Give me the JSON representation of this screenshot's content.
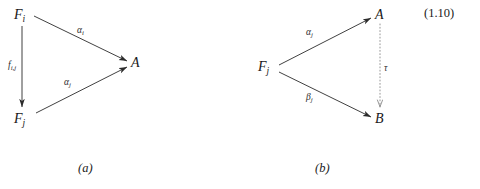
{
  "figure": {
    "equation_number": "(1.10)",
    "line_color": "#2b2b2b",
    "dotted_line_color": "#8a8a8a",
    "text_color": "#1a1a1a",
    "background_color": "#ffffff",
    "diagrams": [
      {
        "id": "a",
        "caption": "(a)",
        "nodes": [
          {
            "name": "node-f-i",
            "base": "F",
            "subscript": "i",
            "x": 14,
            "y": 8
          },
          {
            "name": "node-f-j",
            "base": "F",
            "subscript": "j",
            "x": 14,
            "y": 112
          },
          {
            "name": "node-a",
            "base": "A",
            "subscript": "",
            "x": 131,
            "y": 56
          }
        ],
        "arrows": [
          {
            "name": "arrow-f-i-to-a",
            "from": "F_i",
            "to": "A",
            "label_base": "α",
            "label_sub": "i",
            "style": "solid",
            "label_x": 77,
            "label_y": 26
          },
          {
            "name": "arrow-f-i-to-f-j",
            "from": "F_i",
            "to": "F_j",
            "label_base": "f",
            "label_sub": "i,j",
            "style": "solid",
            "label_x": 8,
            "label_y": 61
          },
          {
            "name": "arrow-f-j-to-a",
            "from": "F_j",
            "to": "A",
            "label_base": "α",
            "label_sub": "j",
            "style": "solid",
            "label_x": 64,
            "label_y": 78
          }
        ]
      },
      {
        "id": "b",
        "caption": "(b)",
        "nodes": [
          {
            "name": "node-f-j",
            "base": "F",
            "subscript": "j",
            "x": 258,
            "y": 60
          },
          {
            "name": "node-a",
            "base": "A",
            "subscript": "",
            "x": 375,
            "y": 8
          },
          {
            "name": "node-b",
            "base": "B",
            "subscript": "",
            "x": 375,
            "y": 112
          }
        ],
        "arrows": [
          {
            "name": "arrow-f-j-to-a",
            "from": "F_j",
            "to": "A",
            "label_base": "α",
            "label_sub": "j",
            "style": "solid",
            "label_x": 306,
            "label_y": 28
          },
          {
            "name": "arrow-f-j-to-b",
            "from": "F_j",
            "to": "B",
            "label_base": "β",
            "label_sub": "j",
            "style": "solid",
            "label_x": 306,
            "label_y": 93
          },
          {
            "name": "arrow-a-to-b",
            "from": "A",
            "to": "B",
            "label_base": "τ",
            "label_sub": "",
            "style": "dotted",
            "label_x": 384,
            "label_y": 64
          }
        ]
      }
    ]
  }
}
